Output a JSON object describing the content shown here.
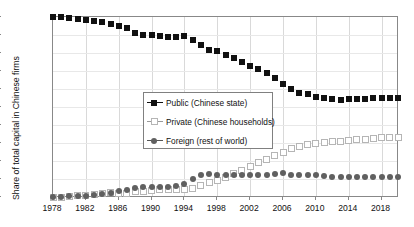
{
  "chart_data": {
    "type": "line",
    "title": "",
    "subtitle": "",
    "xlabel": "",
    "ylabel": "Share of total capital in Chinese firms",
    "xlim": [
      1978,
      2020
    ],
    "ylim": [
      0,
      100
    ],
    "ytick_labels": [
      "0%",
      "10%",
      "20%",
      "30%",
      "40%",
      "50%",
      "60%",
      "70%",
      "80%",
      "90%",
      "100%"
    ],
    "ytick_values": [
      0,
      10,
      20,
      30,
      40,
      50,
      60,
      70,
      80,
      90,
      100
    ],
    "xtick_labels": [
      "1978",
      "1982",
      "1986",
      "1990",
      "1994",
      "1998",
      "2002",
      "2006",
      "2010",
      "2014",
      "2018"
    ],
    "xtick_values": [
      1978,
      1982,
      1986,
      1990,
      1994,
      1998,
      2002,
      2006,
      2010,
      2014,
      2018
    ],
    "grid": "both",
    "legend_position": "center",
    "x": [
      1978,
      1979,
      1980,
      1981,
      1982,
      1983,
      1984,
      1985,
      1986,
      1987,
      1988,
      1989,
      1990,
      1991,
      1992,
      1993,
      1994,
      1995,
      1996,
      1997,
      1998,
      1999,
      2000,
      2001,
      2002,
      2003,
      2004,
      2005,
      2006,
      2007,
      2008,
      2009,
      2010,
      2011,
      2012,
      2013,
      2014,
      2015,
      2016,
      2017,
      2018,
      2019,
      2020
    ],
    "series": [
      {
        "name": "Public (Chinese state)",
        "marker": "filled-square",
        "color": "#111111",
        "values": [
          100,
          100,
          99.6,
          99,
          98.5,
          98,
          97,
          96,
          95,
          94,
          91,
          90,
          90,
          89.5,
          89,
          89,
          89.5,
          87.5,
          84.5,
          81.5,
          81,
          79,
          77,
          75,
          73,
          71,
          69,
          66,
          63,
          60,
          58,
          57,
          55.5,
          55,
          54.5,
          54,
          54.5,
          54.5,
          54.5,
          55,
          55,
          55,
          55
        ]
      },
      {
        "name": "Private (Chinese households)",
        "marker": "open-square",
        "color": "#b5b5b5",
        "values": [
          0,
          0,
          0.4,
          0.6,
          1,
          1.4,
          2,
          2.5,
          2,
          2,
          3,
          3,
          3.5,
          4,
          4,
          4,
          4,
          5,
          6.5,
          8,
          9,
          11,
          13,
          15,
          17,
          19,
          21,
          23,
          25,
          27,
          28,
          29,
          30,
          30.5,
          31,
          31,
          31.5,
          32,
          32,
          32.5,
          33,
          33,
          33
        ]
      },
      {
        "name": "Foreign (rest of world)",
        "marker": "filled-circle",
        "color": "#606060",
        "values": [
          0,
          0,
          0.3,
          0.5,
          0.7,
          1,
          1.5,
          2,
          3.5,
          4,
          5,
          5.5,
          5.5,
          5.5,
          5.5,
          6,
          7,
          10,
          12.5,
          13,
          12.5,
          12.5,
          12.5,
          12.5,
          12.5,
          12.5,
          12.5,
          13,
          13.5,
          12.5,
          12,
          12,
          12,
          11.5,
          11,
          11,
          11,
          11,
          11,
          11,
          11,
          11,
          11
        ]
      }
    ]
  },
  "legend": {
    "entries": [
      {
        "label": "Public (Chinese state)",
        "marker": "filled-square"
      },
      {
        "label": "Private (Chinese households)",
        "marker": "open-square"
      },
      {
        "label": "Foreign (rest of world)",
        "marker": "filled-circle"
      }
    ]
  }
}
